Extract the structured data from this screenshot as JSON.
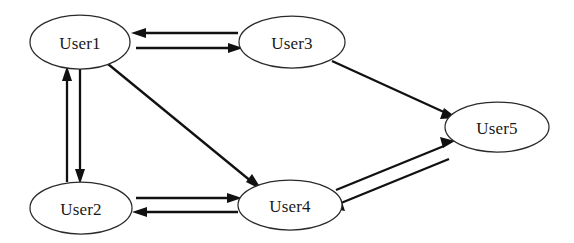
{
  "diagram": {
    "background_color": "#ffffff",
    "node_fill_color": "#ffffff",
    "node_stroke_color": "#2a2a2a",
    "edge_color": "#111111",
    "label_color": "#181818",
    "nodes": [
      {
        "id": "user1",
        "label": "User1",
        "cx": 80,
        "cy": 42,
        "rx": 50,
        "ry": 27
      },
      {
        "id": "user3",
        "label": "User3",
        "cx": 292,
        "cy": 42,
        "rx": 53,
        "ry": 26
      },
      {
        "id": "user5",
        "label": "User5",
        "cx": 497,
        "cy": 127,
        "rx": 52,
        "ry": 25
      },
      {
        "id": "user2",
        "label": "User2",
        "cx": 81,
        "cy": 208,
        "rx": 51,
        "ry": 26
      },
      {
        "id": "user4",
        "label": "User4",
        "cx": 290,
        "cy": 205,
        "rx": 52,
        "ry": 25
      }
    ],
    "edges": [
      {
        "id": "user1-user3",
        "from": "user1",
        "to": "user3",
        "kind": "bidirectional",
        "style": "double-line"
      },
      {
        "id": "user1-user2",
        "from": "user1",
        "to": "user2",
        "kind": "bidirectional",
        "style": "double-line"
      },
      {
        "id": "user1-user4",
        "from": "user1",
        "to": "user4",
        "kind": "directed",
        "style": "single-line"
      },
      {
        "id": "user3-user5",
        "from": "user3",
        "to": "user5",
        "kind": "directed",
        "style": "single-line"
      },
      {
        "id": "user2-user4",
        "from": "user2",
        "to": "user4",
        "kind": "bidirectional",
        "style": "double-line"
      },
      {
        "id": "user4-user5",
        "from": "user4",
        "to": "user5",
        "kind": "bidirectional",
        "style": "double-line"
      }
    ]
  }
}
